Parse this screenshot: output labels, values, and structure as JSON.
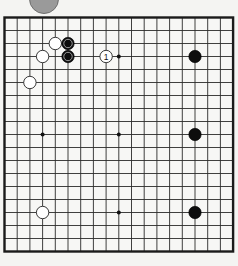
{
  "badge": {
    "label": ""
  },
  "board": {
    "size": 19,
    "origin_x": 4.5,
    "origin_y": 17.5,
    "spacing_x": 12.7,
    "spacing_y": 13.0,
    "line_color": "#2a2a2a",
    "border_color": "#1a1a1a",
    "background": "#f7f7f5",
    "star_points": [
      [
        3,
        3
      ],
      [
        9,
        3
      ],
      [
        15,
        3
      ],
      [
        3,
        9
      ],
      [
        9,
        9
      ],
      [
        15,
        9
      ],
      [
        3,
        15
      ],
      [
        9,
        15
      ],
      [
        15,
        15
      ]
    ],
    "stones": [
      {
        "color": "white",
        "col": 4,
        "row": 2,
        "marked": false,
        "label": ""
      },
      {
        "color": "black",
        "col": 5,
        "row": 2,
        "marked": true,
        "label": ""
      },
      {
        "color": "white",
        "col": 3,
        "row": 3,
        "marked": false,
        "label": ""
      },
      {
        "color": "black",
        "col": 5,
        "row": 3,
        "marked": true,
        "label": ""
      },
      {
        "color": "white",
        "col": 8,
        "row": 3,
        "marked": false,
        "label": "1"
      },
      {
        "color": "white",
        "col": 2,
        "row": 5,
        "marked": false,
        "label": ""
      },
      {
        "color": "black",
        "col": 15,
        "row": 3,
        "marked": false,
        "label": ""
      },
      {
        "color": "black",
        "col": 15,
        "row": 9,
        "marked": false,
        "label": ""
      },
      {
        "color": "white",
        "col": 3,
        "row": 15,
        "marked": false,
        "label": ""
      },
      {
        "color": "black",
        "col": 15,
        "row": 15,
        "marked": false,
        "label": ""
      }
    ]
  }
}
